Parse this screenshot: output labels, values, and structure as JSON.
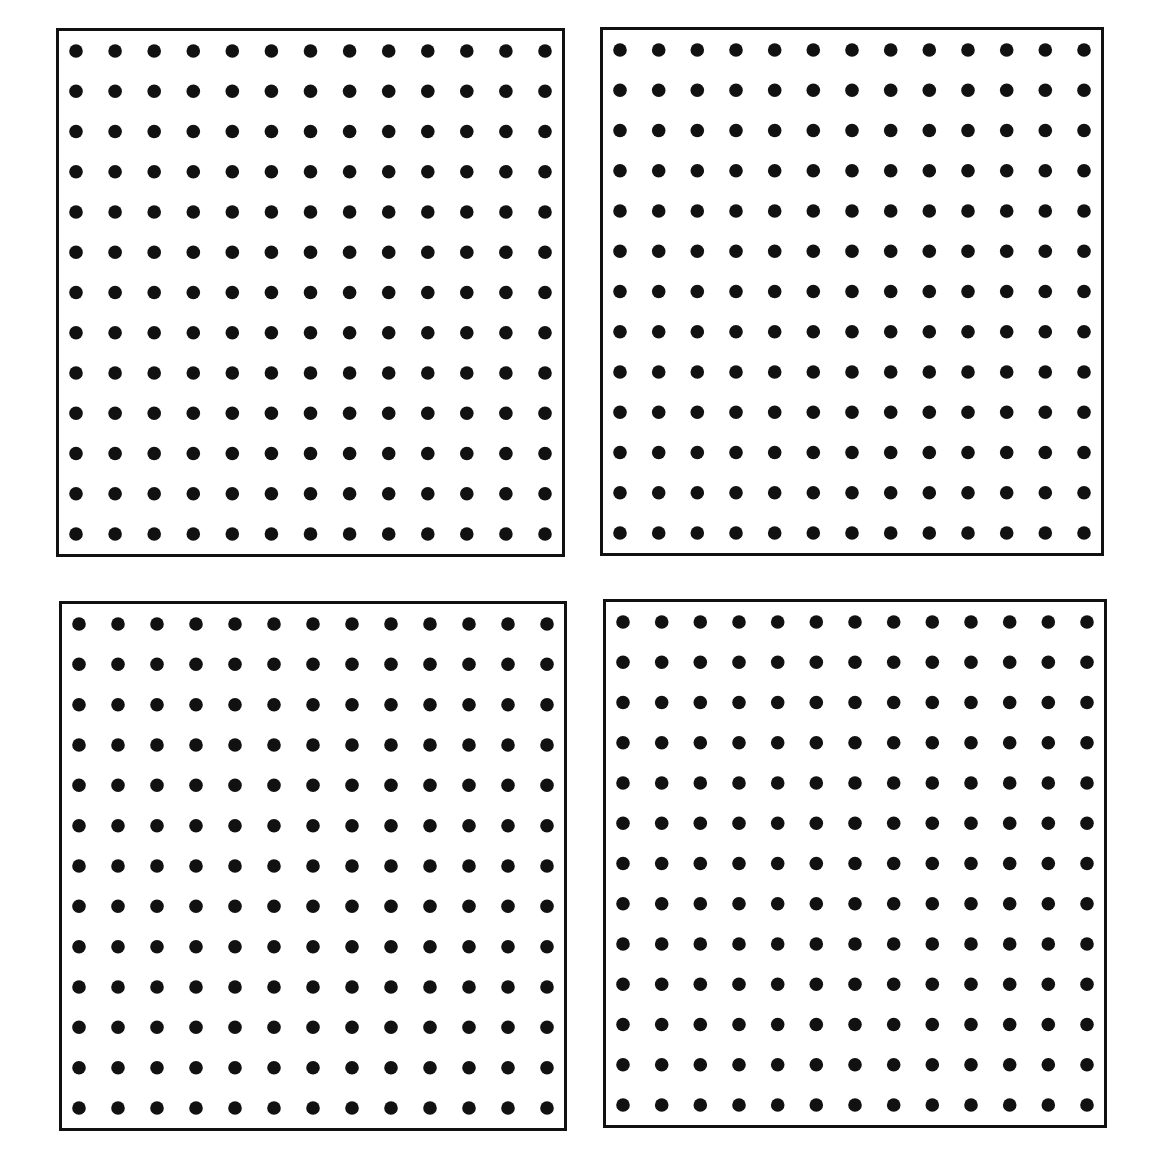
{
  "figure": {
    "background_color": "#ffffff",
    "border_color": "#111111",
    "dot_color": "#111111",
    "panels": [
      {
        "id": "top-left",
        "rows": 13,
        "cols": 13,
        "x": 56,
        "y": 28,
        "w": 509,
        "h": 529
      },
      {
        "id": "top-right",
        "rows": 13,
        "cols": 13,
        "x": 600,
        "y": 27,
        "w": 504,
        "h": 529
      },
      {
        "id": "bottom-left",
        "rows": 13,
        "cols": 13,
        "x": 59,
        "y": 601,
        "w": 508,
        "h": 530
      },
      {
        "id": "bottom-right",
        "rows": 13,
        "cols": 13,
        "x": 603,
        "y": 599,
        "w": 504,
        "h": 529
      }
    ]
  }
}
